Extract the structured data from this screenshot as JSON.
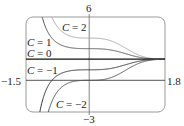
{
  "chart_data": {
    "type": "line",
    "title": "",
    "xlabel": "",
    "ylabel": "",
    "xlim": [
      -1.5,
      1.8
    ],
    "ylim": [
      -3,
      6
    ],
    "grid": false,
    "legend": null,
    "tick_labels": {
      "x_min": "−1.5",
      "x_max": "1.8",
      "y_max": "6",
      "y_min": "−3"
    },
    "family_formula": "y = 2 + C e^(-x^3)",
    "series": [
      {
        "name": "C = 2",
        "C": 2,
        "color": "#a8a8a8",
        "y_at_0": 4
      },
      {
        "name": "C = 1",
        "C": 1,
        "color": "#555555",
        "y_at_0": 3
      },
      {
        "name": "C = 0",
        "C": 0,
        "color": "#111111",
        "y_at_0": 2
      },
      {
        "name": "C = −1",
        "C": -1,
        "color": "#333333",
        "y_at_0": 1
      },
      {
        "name": "C = −2",
        "C": -2,
        "color": "#555555",
        "y_at_0": 0
      }
    ],
    "annotations": [
      {
        "text": "C = 2",
        "series": 0
      },
      {
        "text": "C = 1",
        "series": 1
      },
      {
        "text": "C = 0",
        "series": 2
      },
      {
        "text": "C = −1",
        "series": 3
      },
      {
        "text": "C = −2",
        "series": 4
      }
    ],
    "convergence": {
      "x": 1.4,
      "y": 2
    }
  },
  "labels": {
    "c2": {
      "var": "C",
      "eq": " = 2"
    },
    "c1": {
      "var": "C",
      "eq": " = 1"
    },
    "c0": {
      "var": "C",
      "eq": " = 0"
    },
    "cm1": {
      "var": "C",
      "eq": " = −1"
    },
    "cm2": {
      "var": "C",
      "eq": " = −2"
    }
  }
}
